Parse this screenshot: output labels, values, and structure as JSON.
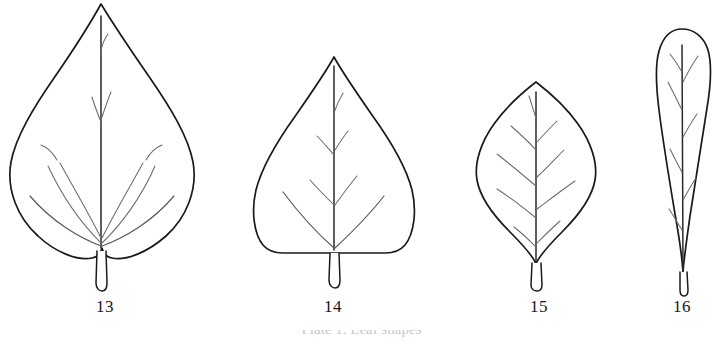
{
  "plate": {
    "background_color": "#ffffff",
    "ink_color": "#1a1a1a",
    "vein_color": "#6b6b6b",
    "caption_partial": "Plate 1.  Leaf shapes",
    "figures": [
      {
        "number": "13",
        "name": "cordate-ovate-leaf",
        "shape": "broadly ovate with cordate base and acuminate apex",
        "apex": "acuminate",
        "base": "cordate",
        "label_x": 105,
        "label_y": 297
      },
      {
        "number": "14",
        "name": "deltoid-leaf",
        "shape": "deltoid / triangular with truncate base",
        "apex": "acute",
        "base": "truncate",
        "label_x": 333,
        "label_y": 297
      },
      {
        "number": "15",
        "name": "rhombic-leaf",
        "shape": "rhombic / diamond-shaped",
        "apex": "acute",
        "base": "cuneate",
        "label_x": 539,
        "label_y": 297
      },
      {
        "number": "16",
        "name": "obovate-spatulate-leaf",
        "shape": "obovate / spatulate, widest above middle",
        "apex": "rounded",
        "base": "attenuate",
        "label_x": 682,
        "label_y": 297
      }
    ]
  }
}
